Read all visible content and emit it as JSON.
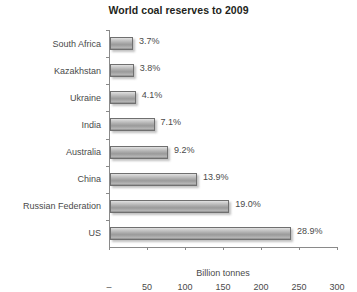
{
  "chart_data": {
    "type": "bar",
    "orientation": "horizontal",
    "title": "World coal reserves to 2009",
    "xlabel": "Billion tonnes",
    "ylabel": "",
    "xlim": [
      0,
      300
    ],
    "xticks": [
      "–",
      "50",
      "100",
      "150",
      "200",
      "250",
      "300"
    ],
    "xtick_values": [
      0,
      50,
      100,
      150,
      200,
      250,
      300
    ],
    "grid": false,
    "legend": null,
    "categories": [
      "South Africa",
      "Kazakhstan",
      "Ukraine",
      "India",
      "Australia",
      "China",
      "Russian Federation",
      "US"
    ],
    "values": [
      30.2,
      31.3,
      33.9,
      58.6,
      76.4,
      114.5,
      157.0,
      238.3
    ],
    "data_labels": [
      "3.7%",
      "3.8%",
      "4.1%",
      "7.1%",
      "9.2%",
      "13.9%",
      "19.0%",
      "28.9%"
    ],
    "percentages": [
      3.7,
      3.8,
      4.1,
      7.1,
      9.2,
      13.9,
      19.0,
      28.9
    ],
    "bar_color": "#a9a9a9",
    "bar_border_color": "#6f6f6f",
    "axis_color": "#8a8a8a",
    "text_color": "#4a4a4a",
    "title_color": "#231f20",
    "background": "#ffffff"
  }
}
